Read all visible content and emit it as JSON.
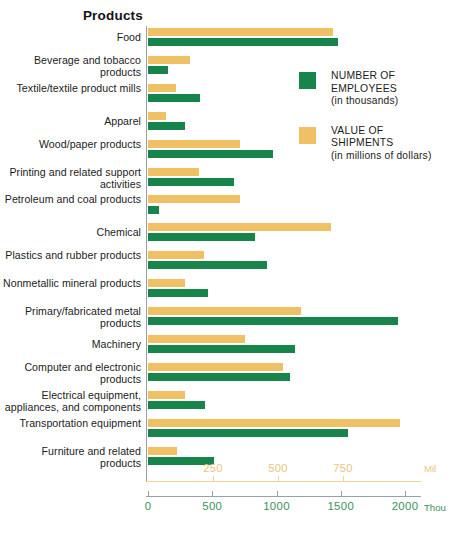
{
  "chart_data": {
    "type": "bar",
    "orientation": "horizontal",
    "title": "Products",
    "xlabel": "",
    "ylabel": "Products",
    "grid": false,
    "legend_position": "upper-right-inside",
    "categories": [
      "Food",
      "Beverage and tobacco products",
      "Textile/textile product mills",
      "Apparel",
      "Wood/paper products",
      "Printing and related support activities",
      "Petroleum and coal products",
      "Chemical",
      "Plastics and rubber products",
      "Nonmetallic mineral products",
      "Primary/fabricated metal products",
      "Machinery",
      "Computer and electronic products",
      "Electrical equipment, appliances, and components",
      "Transportation equipment",
      "Furniture and related products"
    ],
    "series": [
      {
        "name": "VALUE OF SHIPMENTS",
        "unit": "millions of dollars",
        "color": "#efc164",
        "axis": "mil",
        "axis_max": 1000,
        "values": [
          712,
          162,
          108,
          69,
          354,
          196,
          354,
          704,
          215,
          142,
          588,
          373,
          519,
          142,
          969,
          112
        ]
      },
      {
        "name": "NUMBER OF EMPLOYEES",
        "unit": "thousands",
        "color": "#17854b",
        "axis": "thou",
        "axis_max": 2150,
        "values": [
          1478,
          156,
          405,
          288,
          973,
          669,
          86,
          833,
          926,
          467,
          1946,
          1144,
          1105,
          444,
          1557,
          514
        ]
      }
    ],
    "axes": {
      "thou": {
        "label": "Thou",
        "color": "#3d8f63",
        "ticks": [
          0,
          500,
          1000,
          1500,
          2000
        ],
        "range": [
          0,
          2150
        ]
      },
      "mil": {
        "label": "Mil",
        "color": "#e9c67e",
        "ticks": [
          250,
          500,
          750
        ],
        "range": [
          0,
          1000
        ]
      }
    }
  },
  "legend": {
    "items": [
      {
        "swatch": "green",
        "line1": "NUMBER OF",
        "line2": "EMPLOYEES",
        "line3": "(in thousands)"
      },
      {
        "swatch": "orange",
        "line1": "VALUE OF",
        "line2": "SHIPMENTS",
        "line3": "(in millions of dollars)"
      }
    ]
  }
}
